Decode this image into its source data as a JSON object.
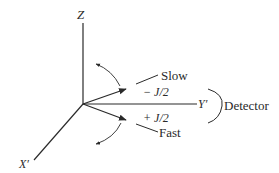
{
  "diagram": {
    "axes": {
      "z_label": "Z",
      "y_label": "Y′",
      "x_label": "X′"
    },
    "arrows": {
      "slow_label": "Slow",
      "fast_label": "Fast",
      "minus_label": "− J/2",
      "plus_label": "+ J/2"
    },
    "detector_label": "Detector",
    "colors": {
      "ink": "#2a2a2a",
      "background": "#ffffff"
    }
  }
}
